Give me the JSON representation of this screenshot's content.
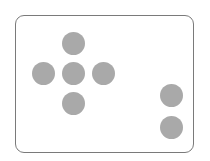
{
  "controller": {
    "frame": {
      "x": 15,
      "y": 15,
      "width": 180,
      "height": 139,
      "border_color": "#7a7a7a",
      "corner_radius": 9
    },
    "button_color": "#a9a9a9",
    "button_diameter": 23,
    "dpad": [
      {
        "id": "up",
        "cx": 73,
        "cy": 43
      },
      {
        "id": "left",
        "cx": 43,
        "cy": 73
      },
      {
        "id": "center",
        "cx": 73,
        "cy": 73
      },
      {
        "id": "right",
        "cx": 103,
        "cy": 73
      },
      {
        "id": "down",
        "cx": 73,
        "cy": 103
      }
    ],
    "action_buttons": [
      {
        "id": "a",
        "cx": 171,
        "cy": 95
      },
      {
        "id": "b",
        "cx": 171,
        "cy": 127
      }
    ]
  }
}
